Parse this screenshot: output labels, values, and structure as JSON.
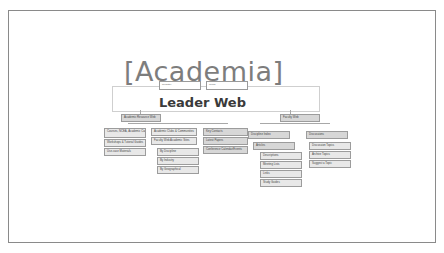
{
  "brand": "[Academia]",
  "title": "Leader Web",
  "header_fields": [
    {
      "label": "Register"
    },
    {
      "label": "Guide"
    }
  ],
  "sections": {
    "academic": {
      "label": "Academic Resource Web",
      "col1": [
        "Courses, NCEA, Academic Careers/Scholarships",
        "Workshops & Tutorial Guides",
        "Use-case Materials"
      ],
      "col2": [
        "Academic Clubs & Communities",
        "Faculty Web Academic Sites"
      ],
      "col2_sub": [
        "By Discipline",
        "By Industry",
        "By Geographical"
      ],
      "col3": [
        "Key Contacts",
        "Latest Papers",
        "Conference Calendar/Events"
      ]
    },
    "faculty": {
      "label": "Faculty Web",
      "left": [
        "Discipline Index",
        "Articles"
      ],
      "left_sub": [
        "Descriptions",
        "Meeting Lists",
        "Links",
        "Study Guides"
      ],
      "right": [
        "Discussions"
      ],
      "right_sub": [
        "Discussion Topics",
        "Archive Topics",
        "Suggest a Topic"
      ]
    }
  }
}
